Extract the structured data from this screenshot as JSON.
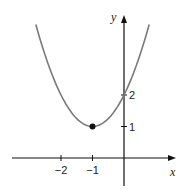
{
  "chart_data": {
    "type": "line",
    "title": "",
    "function": "y = (x + 1)^2 + 1",
    "xlabel": "x",
    "ylabel": "y",
    "x_ticks": [
      {
        "value": -2,
        "label": "−2"
      },
      {
        "value": -1,
        "label": "−1"
      }
    ],
    "y_ticks": [
      {
        "value": 1,
        "label": "1"
      },
      {
        "value": 2,
        "label": "2"
      }
    ],
    "xlim": [
      -3.6,
      1.65
    ],
    "ylim": [
      -1.15,
      4.8
    ],
    "grid": false,
    "legend": null,
    "series": [
      {
        "name": "parabola",
        "x": [
          -2.8,
          -2.5,
          -2,
          -1.5,
          -1,
          -0.5,
          0,
          0.5,
          0.8
        ],
        "y": [
          4.24,
          3.25,
          2,
          1.25,
          1,
          1.25,
          2,
          3.25,
          4.24
        ],
        "color": "#7a7a7a"
      }
    ],
    "annotations": [
      {
        "type": "point",
        "x": -1,
        "y": 1,
        "label": "vertex",
        "color": "#111111"
      }
    ]
  },
  "colors": {
    "axis": "#111111",
    "curve": "#7a7a7a",
    "point": "#111111"
  }
}
